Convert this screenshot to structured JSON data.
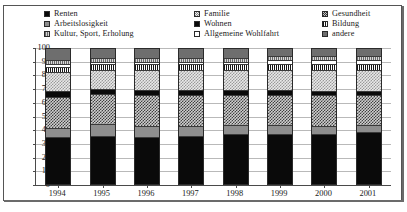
{
  "chart_data": {
    "type": "bar",
    "subtype": "stacked-percentage",
    "title": "",
    "xlabel": "",
    "ylabel": "",
    "ylim": [
      0,
      100
    ],
    "yticks": [
      0,
      10,
      20,
      30,
      40,
      50,
      60,
      70,
      80,
      90,
      100
    ],
    "ytick_labels": [
      "0",
      "10",
      "20",
      "30",
      "40",
      "50",
      "60",
      "70",
      "80",
      "90",
      "100"
    ],
    "grid": true,
    "legend_position": "top",
    "legend_columns": 3,
    "categories": [
      "1994",
      "1995",
      "1996",
      "1997",
      "1998",
      "1999",
      "2000",
      "2001"
    ],
    "series": [
      {
        "name": "Renten",
        "pattern": "solid-black",
        "fill_class": "fill-solid-black",
        "swatch_class": "sw-solid-black",
        "values": [
          34,
          35,
          34,
          35,
          36,
          36,
          36,
          38
        ]
      },
      {
        "name": "Arbeitslosigkeit",
        "pattern": "gray-medium",
        "fill_class": "fill-gray-med",
        "swatch_class": "sw-gray-med",
        "values": [
          7,
          9,
          8,
          7,
          7,
          7,
          6,
          5
        ]
      },
      {
        "name": "Gesundheit",
        "pattern": "checker-dark",
        "fill_class": "fill-check-dark",
        "swatch_class": "sw-check-dark",
        "values": [
          23,
          22,
          23,
          23,
          22,
          22,
          23,
          22
        ]
      },
      {
        "name": "Wohnen",
        "pattern": "solid-black",
        "fill_class": "fill-solid-black",
        "swatch_class": "sw-solid-black",
        "values": [
          4,
          4,
          4,
          4,
          4,
          4,
          3,
          3
        ]
      },
      {
        "name": "Familie",
        "pattern": "checker-light",
        "fill_class": "fill-check-light",
        "swatch_class": "sw-check-light",
        "values": [
          14,
          14,
          15,
          15,
          15,
          15,
          16,
          16
        ]
      },
      {
        "name": "Bildung",
        "pattern": "vertical-stripe",
        "fill_class": "fill-vstripe",
        "swatch_class": "sw-vstripe",
        "values": [
          4,
          4,
          4,
          4,
          4,
          4,
          4,
          4
        ]
      },
      {
        "name": "Allgemeine Wohlfahrt",
        "pattern": "white",
        "fill_class": "fill-white",
        "swatch_class": "sw-white",
        "values": [
          2,
          2,
          2,
          2,
          2,
          3,
          3,
          3
        ]
      },
      {
        "name": "Kultur, Sport, Erholung",
        "pattern": "vertical-stripe-gray",
        "fill_class": "fill-vstripe-gray",
        "swatch_class": "sw-vstripe-gray",
        "values": [
          3,
          3,
          3,
          3,
          3,
          3,
          3,
          3
        ]
      },
      {
        "name": "andere",
        "pattern": "gray-dark",
        "fill_class": "fill-gray-dark",
        "swatch_class": "sw-gray-dark",
        "values": [
          9,
          7,
          7,
          7,
          7,
          6,
          6,
          6
        ]
      }
    ]
  },
  "legend": {
    "items": [
      {
        "label": "Renten",
        "swatch_class": "sw-solid-black"
      },
      {
        "label": "Familie",
        "swatch_class": "sw-check-light"
      },
      {
        "label": "Gesundheit",
        "swatch_class": "sw-check-dark"
      },
      {
        "label": "Arbeitslosigkeit",
        "swatch_class": "sw-gray-med"
      },
      {
        "label": "Wohnen",
        "swatch_class": "sw-solid-black"
      },
      {
        "label": "Bildung",
        "swatch_class": "sw-vstripe"
      },
      {
        "label": "Kultur, Sport, Erholung",
        "swatch_class": "sw-vstripe-gray"
      },
      {
        "label": "Allgemeine Wohlfahrt",
        "swatch_class": "sw-white"
      },
      {
        "label": "andere",
        "swatch_class": "sw-gray-dark"
      }
    ]
  }
}
